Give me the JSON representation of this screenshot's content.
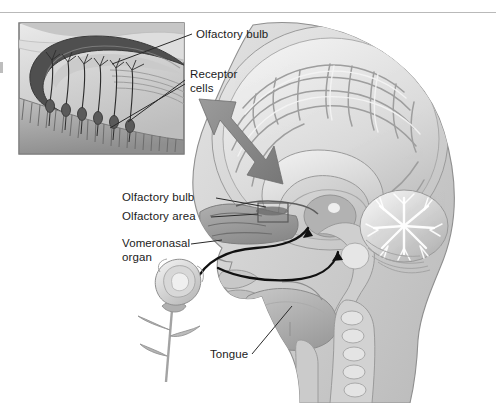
{
  "figure": {
    "background_color": "#ffffff",
    "top_rule_color": "#b9b9b9",
    "width": 496,
    "height": 403
  },
  "labels": {
    "inset_olfactory_bulb": "Olfactory bulb",
    "inset_receptor_cells": "Receptor\ncells",
    "head_olfactory_bulb": "Olfactory bulb",
    "head_olfactory_area": "Olfactory area",
    "head_vomeronasal_organ": "Vomeronasal\norgan",
    "head_tongue": "Tongue"
  },
  "inset": {
    "name": "olfactory-epithelium-inset",
    "border_color": "#6e6e6e",
    "background_color": "#d8d8d8",
    "bulb_color": "#4a4a4a",
    "epithelium_color": "#9a9a9a",
    "receptor_cell_count": 6
  },
  "head": {
    "name": "sagittal-head-section",
    "skin_color": "#d6d6d6",
    "brain_color": "#dcdcdc",
    "cerebellum_color": "#cfcfcf",
    "nasal_color": "#9d9d9d",
    "tongue_color": "#b0b0b0",
    "outline_color": "#8a8a8a"
  },
  "markers": {
    "olfactory_area_box_color": "#5a5a5a",
    "zoom_arrow_color": "#8d8d8d",
    "airflow_arrow_color": "#111111",
    "leader_line_color": "#2a2a2a"
  },
  "flower": {
    "name": "rose-odor-source",
    "petal_color": "#d2d2d2",
    "stem_color": "#a8a8a8"
  }
}
